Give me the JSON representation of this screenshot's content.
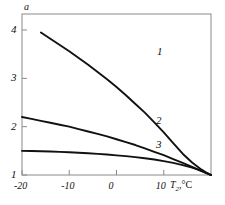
{
  "chart_data": {
    "type": "line",
    "title": "",
    "xlabel": "T2,°C",
    "ylabel": "a",
    "xlim": [
      -20,
      20
    ],
    "ylim": [
      1,
      4.2
    ],
    "grid": false,
    "legend": "inline-curve-labels",
    "xticks": [
      -20,
      -10,
      0,
      10
    ],
    "xtick_labels": [
      "-20",
      "-10",
      "0",
      "10"
    ],
    "yticks": [
      1,
      2,
      3,
      4
    ],
    "ytick_labels": [
      "1",
      "2",
      "3",
      "4"
    ],
    "series": [
      {
        "name": "1",
        "label": "1",
        "color": "#111111",
        "x": [
          -16,
          -14,
          -12,
          -10,
          -8,
          -6,
          -4,
          -2,
          0,
          2,
          4,
          6,
          8,
          10,
          12,
          14,
          16,
          18,
          19,
          20
        ],
        "y": [
          3.95,
          3.82,
          3.69,
          3.56,
          3.42,
          3.28,
          3.13,
          2.98,
          2.82,
          2.65,
          2.47,
          2.29,
          2.09,
          1.88,
          1.66,
          1.44,
          1.26,
          1.11,
          1.05,
          1.0
        ]
      },
      {
        "name": "2",
        "label": "2",
        "color": "#111111",
        "x": [
          -20,
          -18,
          -16,
          -14,
          -12,
          -10,
          -8,
          -6,
          -4,
          -2,
          0,
          2,
          4,
          6,
          8,
          10,
          12,
          14,
          16,
          18,
          19,
          20
        ],
        "y": [
          2.2,
          2.16,
          2.12,
          2.08,
          2.04,
          2.0,
          1.95,
          1.9,
          1.85,
          1.8,
          1.74,
          1.68,
          1.62,
          1.55,
          1.48,
          1.41,
          1.33,
          1.25,
          1.17,
          1.08,
          1.04,
          1.0
        ]
      },
      {
        "name": "3",
        "label": "3",
        "color": "#111111",
        "x": [
          -20,
          -18,
          -16,
          -14,
          -12,
          -10,
          -8,
          -6,
          -4,
          -2,
          0,
          2,
          4,
          6,
          8,
          10,
          12,
          14,
          16,
          18,
          19,
          20
        ],
        "y": [
          1.5,
          1.495,
          1.49,
          1.485,
          1.478,
          1.47,
          1.46,
          1.45,
          1.437,
          1.423,
          1.407,
          1.39,
          1.37,
          1.347,
          1.32,
          1.287,
          1.25,
          1.205,
          1.152,
          1.085,
          1.045,
          1.0
        ]
      }
    ],
    "curve_labels": [
      {
        "text": "1",
        "x": 9.2,
        "y": 3.55
      },
      {
        "text": "2",
        "x": 9.0,
        "y": 2.12
      },
      {
        "text": "3",
        "x": 9.0,
        "y": 1.63
      }
    ]
  },
  "axes": {
    "y_axis_name": "a",
    "x_axis_name_main": "T",
    "x_axis_name_sub": "2",
    "x_axis_name_rest": ",°C"
  }
}
